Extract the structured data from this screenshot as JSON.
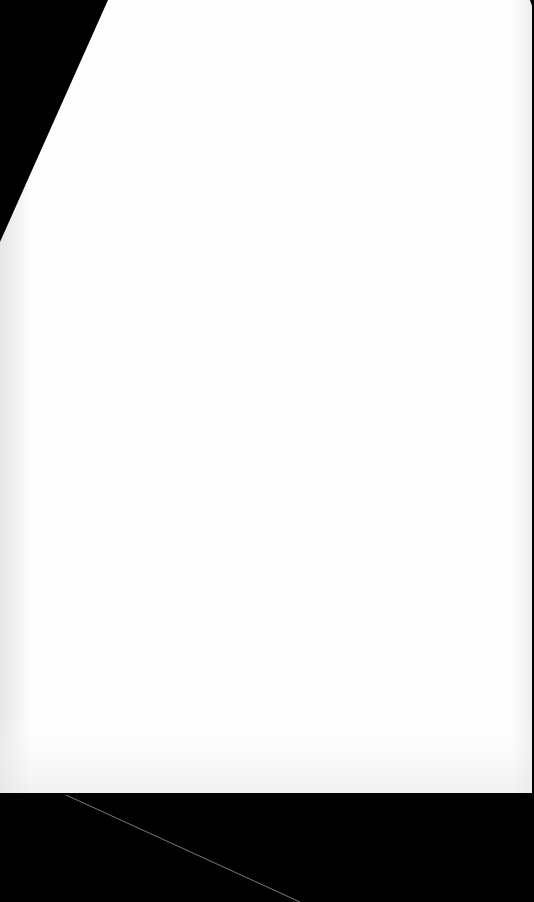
{
  "scene": {
    "background_color": "#000000",
    "paper": {
      "color": "#fefefe",
      "edge_shade": "#ececec",
      "points": "108,0 530,0 532,6 532,793 0,793 0,242"
    },
    "crease_line": {
      "color": "#7a7a7a",
      "x1": 66,
      "y1": 795,
      "x2": 300,
      "y2": 902
    }
  }
}
